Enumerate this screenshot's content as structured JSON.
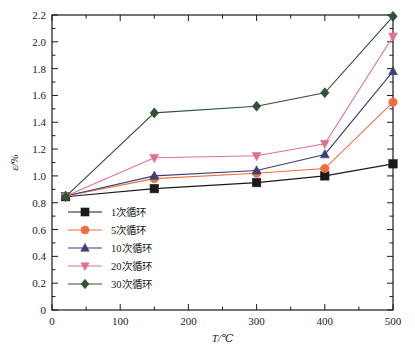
{
  "chart_data": {
    "type": "line",
    "title": "",
    "xlabel": "T/℃",
    "ylabel": "ε/%",
    "xlim": [
      0,
      500
    ],
    "ylim": [
      0,
      2.2
    ],
    "xticks": [
      0,
      100,
      200,
      300,
      400,
      500
    ],
    "xtick_labels": [
      "0",
      "100",
      "200",
      "300",
      "400",
      "500"
    ],
    "yticks": [
      0,
      0.2,
      0.4,
      0.6,
      0.8,
      1.0,
      1.2,
      1.4,
      1.6,
      1.8,
      2.0,
      2.2
    ],
    "ytick_labels": [
      "0",
      "0.2",
      "0.4",
      "0.6",
      "0.8",
      "1.0",
      "1.2",
      "1.4",
      "1.6",
      "1.8",
      "2.0",
      "2.2"
    ],
    "grid": false,
    "legend_position": "lower-left-inside",
    "x": [
      20,
      150,
      300,
      400,
      500
    ],
    "series": [
      {
        "name": "1次循环",
        "color": "#1a1a1a",
        "marker": "square",
        "values": [
          0.845,
          0.905,
          0.95,
          1.0,
          1.09
        ]
      },
      {
        "name": "5次循环",
        "color": "#f26d3d",
        "marker": "circle",
        "values": [
          0.85,
          0.98,
          1.02,
          1.055,
          1.55
        ]
      },
      {
        "name": "10次循环",
        "color": "#3c3f7a",
        "marker": "triangle-up",
        "values": [
          0.85,
          1.0,
          1.04,
          1.16,
          1.78
        ]
      },
      {
        "name": "20次循环",
        "color": "#e0708f",
        "marker": "triangle-down",
        "values": [
          0.848,
          1.135,
          1.15,
          1.24,
          2.04
        ]
      },
      {
        "name": "30次循环",
        "color": "#2f5233",
        "marker": "diamond",
        "values": [
          0.845,
          1.47,
          1.52,
          1.62,
          2.19
        ]
      }
    ]
  },
  "legend": {
    "entries": [
      {
        "label": "1次循环"
      },
      {
        "label": "5次循环"
      },
      {
        "label": "10次循环"
      },
      {
        "label": "20次循环"
      },
      {
        "label": "30次循环"
      }
    ]
  },
  "axes": {
    "x_title": "T/℃",
    "y_title": "ε/%"
  }
}
